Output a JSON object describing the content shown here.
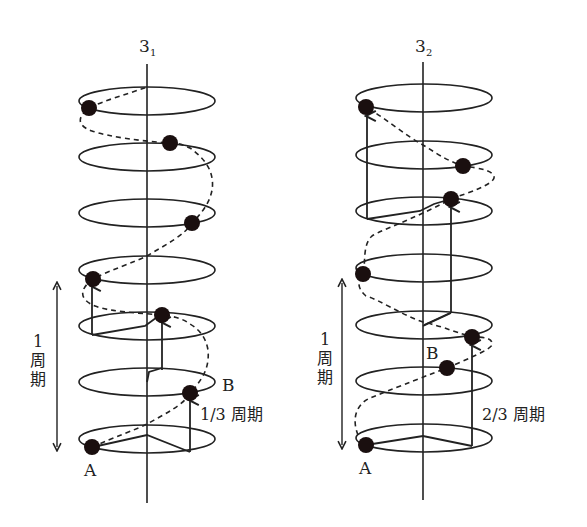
{
  "colors": {
    "ink": "#222222",
    "ball": "#1a0f0f",
    "background": "#ffffff"
  },
  "diagrams": [
    {
      "id": "left",
      "axis_label": "3",
      "axis_subscript": "1",
      "period_label_number": "1",
      "period_label_chars": [
        "周",
        "期"
      ],
      "point_a": "A",
      "point_b": "B",
      "step_label": "1/3 周期"
    },
    {
      "id": "right",
      "axis_label": "3",
      "axis_subscript": "2",
      "period_label_number": "1",
      "period_label_chars": [
        "周",
        "期"
      ],
      "point_a": "A",
      "point_b": "B",
      "step_label": "2/3 周期"
    }
  ]
}
